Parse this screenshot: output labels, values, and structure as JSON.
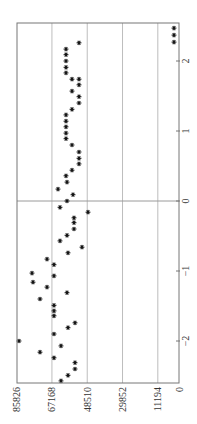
{
  "chart_data": {
    "type": "scatter",
    "orientation": "rotated-90-ccw",
    "title": "",
    "xlabel": "",
    "ylabel": "",
    "marker": "*",
    "grid": true,
    "legend": null,
    "xlim": [
      -2.61,
      2.54
    ],
    "ylim": [
      0,
      85826
    ],
    "xticks": [
      -2,
      -1,
      0,
      1,
      2
    ],
    "xtick_labels": [
      "−2",
      "−1",
      "0",
      "1",
      "2"
    ],
    "yticks": [
      0,
      11194,
      29852,
      48510,
      67168,
      85826
    ],
    "ytick_labels": [
      "0",
      "11194",
      "29852",
      "48510",
      "67168",
      "85826"
    ],
    "series": [
      {
        "name": "points",
        "x": [
          2.47,
          2.37,
          2.27,
          2.26,
          2.17,
          2.09,
          2.0,
          1.91,
          1.83,
          1.74,
          1.74,
          1.66,
          1.57,
          1.49,
          1.4,
          1.31,
          1.23,
          1.14,
          1.06,
          0.97,
          0.89,
          0.8,
          0.7,
          0.61,
          0.53,
          0.44,
          0.36,
          0.27,
          0.17,
          0.09,
          0.0,
          -0.09,
          -0.16,
          -0.24,
          -0.31,
          -0.4,
          -0.49,
          -0.57,
          -0.66,
          -0.74,
          -0.83,
          -0.91,
          -1.03,
          -1.07,
          -1.16,
          -1.23,
          -1.31,
          -1.4,
          -1.49,
          -1.57,
          -1.64,
          -1.74,
          -1.81,
          -1.9,
          -2.0,
          -2.07,
          -2.16,
          -2.24,
          -2.31,
          -2.4,
          -2.49,
          -2.57
        ],
        "y": [
          2643,
          2643,
          2643,
          52860,
          59732,
          59732,
          59732,
          59732,
          59732,
          56560,
          52860,
          52860,
          56560,
          52860,
          52860,
          56560,
          59732,
          59732,
          59732,
          59732,
          59732,
          56560,
          52860,
          52860,
          52860,
          56560,
          59732,
          59203,
          63961,
          56032,
          59203,
          62903,
          48103,
          55503,
          55503,
          55503,
          59203,
          62903,
          51274,
          58675,
          69775,
          66075,
          77704,
          66075,
          77176,
          69775,
          59203,
          73475,
          66075,
          66075,
          66075,
          54974,
          58675,
          66075,
          84576,
          62375,
          73475,
          66075,
          54974,
          54974,
          58675,
          62375
        ]
      }
    ]
  },
  "colors": {
    "background": "#ffffff",
    "frame": "#777777",
    "grid": "#bdbdbd",
    "zero_line": "#9a9a9a",
    "marker": "#111111",
    "text": "#333333"
  },
  "layout_px": {
    "plot_left": 17,
    "plot_right": 179,
    "plot_top": 23,
    "plot_bottom": 383,
    "value_zero_px": 179,
    "px_per_value": 0.0018918,
    "x_zero_py": 201,
    "px_per_x": 70
  }
}
